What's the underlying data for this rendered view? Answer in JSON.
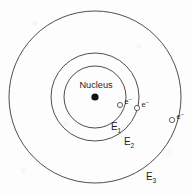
{
  "figure": {
    "name": "bohr-atomic-model",
    "width": 193,
    "height": 194,
    "background_color": "#fdfdfd",
    "stroke_color": "#3a3a3a",
    "text_color": "#1f1f1f",
    "nucleus_color": "#111111"
  },
  "chart_data": {
    "type": "diagram",
    "center": {
      "x": 95,
      "y": 97
    },
    "nucleus": {
      "label": "Nucleus",
      "label_x": 96,
      "label_y": 88,
      "dot_x": 95,
      "dot_y": 97,
      "dot_radius": 3.6
    },
    "shells": [
      {
        "id": "E1",
        "label": "E",
        "subscript": "1",
        "radius": 31,
        "label_x": 111,
        "label_y": 130,
        "energy_level": 1
      },
      {
        "id": "E2",
        "label": "E",
        "subscript": "2",
        "radius": 44,
        "label_x": 124,
        "label_y": 145,
        "energy_level": 2
      },
      {
        "id": "E3",
        "label": "E",
        "subscript": "3",
        "radius": 86,
        "label_x": 146,
        "label_y": 180,
        "energy_level": 3
      }
    ],
    "electrons": [
      {
        "id": "electron-shell-1",
        "shell": "E1",
        "symbol": "e",
        "superscript": "–",
        "x": 120,
        "y": 105,
        "radius": 2.6
      },
      {
        "id": "electron-shell-2",
        "shell": "E2",
        "symbol": "e",
        "superscript": "–",
        "x": 137,
        "y": 108,
        "radius": 2.6
      },
      {
        "id": "electron-shell-3",
        "shell": "E3",
        "symbol": "e",
        "superscript": "–",
        "x": 172,
        "y": 120,
        "radius": 2.6
      }
    ]
  }
}
